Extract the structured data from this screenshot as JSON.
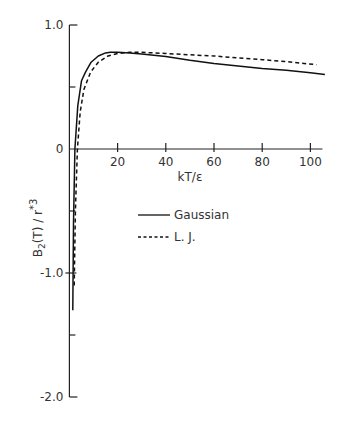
{
  "chart_data": {
    "type": "line",
    "title": "",
    "xlabel": "kT/ε",
    "ylabel": "B₂(T)/r*³",
    "xlim": [
      0,
      105
    ],
    "ylim": [
      -2.0,
      1.0
    ],
    "grid": false,
    "legend_position": "center-right",
    "x_ticks": [
      20,
      40,
      60,
      80,
      100
    ],
    "x_tick_labels": [
      "20",
      "40",
      "60",
      "80",
      "100"
    ],
    "y_ticks": [
      1.0,
      0,
      -1.0,
      -2.0
    ],
    "y_tick_labels": [
      "1.0",
      "0",
      "-1.0",
      "-2.0"
    ],
    "y_minor_ticks": [
      0.5,
      -0.5,
      -1.5
    ],
    "series": [
      {
        "name": "Gaussian",
        "style": "solid",
        "x": [
          1.4,
          1.7,
          2.3,
          3.5,
          5.0,
          6.7,
          9.0,
          12.0,
          15.0,
          17.0,
          20.0,
          25.0,
          30.0,
          40.0,
          50.0,
          60.0,
          70.0,
          80.0,
          90.0,
          100.0,
          106.0
        ],
        "y": [
          -1.3,
          -0.6,
          0.0,
          0.35,
          0.55,
          0.62,
          0.7,
          0.75,
          0.775,
          0.78,
          0.78,
          0.775,
          0.765,
          0.745,
          0.715,
          0.69,
          0.67,
          0.65,
          0.635,
          0.615,
          0.6
        ]
      },
      {
        "name": "L. J.",
        "style": "dashed",
        "x": [
          2.0,
          2.5,
          3.3,
          4.5,
          6.0,
          8.8,
          12.0,
          16.0,
          20.0,
          25.0,
          30.0,
          40.0,
          50.0,
          60.0,
          70.0,
          80.0,
          90.0,
          102.5
        ],
        "y": [
          -1.1,
          -0.5,
          0.0,
          0.3,
          0.48,
          0.62,
          0.7,
          0.75,
          0.77,
          0.78,
          0.78,
          0.77,
          0.76,
          0.75,
          0.735,
          0.72,
          0.705,
          0.68
        ]
      }
    ]
  },
  "labels": {
    "xlabel": "kT/ε",
    "ylabel_main": "B",
    "ylabel_sub": "2",
    "ylabel_rest": "(T) / r",
    "ylabel_sup": "*3",
    "legend": [
      "Gaussian",
      "L. J."
    ]
  }
}
